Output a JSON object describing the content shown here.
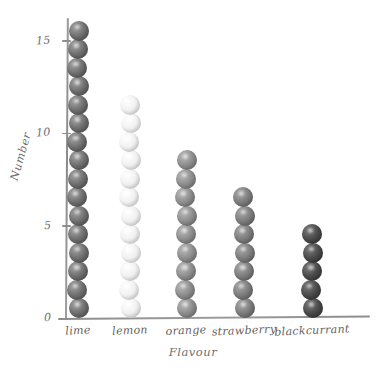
{
  "chart_data": {
    "type": "bar",
    "style": "hand-drawn pictogram of stacked spheres, one sphere per unit",
    "title": "",
    "xlabel": "Flavour",
    "ylabel": "Number",
    "categories": [
      "lime",
      "lemon",
      "orange",
      "strawberry",
      "blackcurrant"
    ],
    "values": [
      16,
      12,
      9,
      7,
      5
    ],
    "series": [
      {
        "name": "Number",
        "values": [
          16,
          12,
          9,
          7,
          5
        ]
      }
    ],
    "ylim": [
      0,
      17
    ],
    "yticks": [
      0,
      5,
      10,
      15
    ],
    "ytick_labels": [
      "0",
      "5",
      "10",
      "15"
    ],
    "grid": false,
    "legend": null,
    "colors": {
      "lime": "#6f6f6f",
      "lemon": "#f2f2f2",
      "orange": "#8e8e8e",
      "strawberry": "#7d7d7d",
      "blackcurrant": "#4a4a4a",
      "axis": "#8d8d8d",
      "text": "#6f6f6f",
      "background": "#ffffff"
    }
  },
  "axes": {
    "y_title": "Number",
    "x_title": "Flavour",
    "ticks": [
      {
        "label": "15"
      },
      {
        "label": "10"
      },
      {
        "label": "5"
      },
      {
        "label": "0"
      }
    ]
  }
}
